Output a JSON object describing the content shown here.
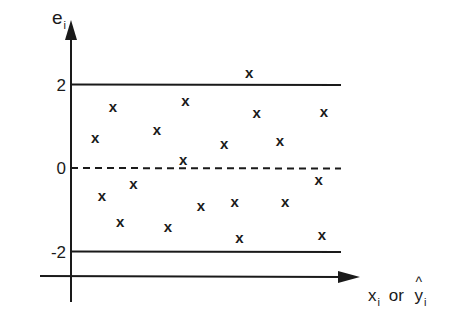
{
  "chart_data": {
    "type": "scatter",
    "title": "",
    "ylabel": "e",
    "ylabel_subscript": "i",
    "xlabel_parts": [
      "x",
      "i",
      "or",
      "y",
      "i"
    ],
    "xlabel": "x_i or ŷ_i",
    "yticks": [
      2,
      0,
      -2
    ],
    "ytick_labels": [
      "2",
      "0",
      "-2"
    ],
    "reference_lines": [
      {
        "y": 2,
        "style": "solid"
      },
      {
        "y": 0,
        "style": "dashed"
      },
      {
        "y": -2,
        "style": "solid"
      }
    ],
    "marker": "x",
    "ylim": [
      -2.6,
      3.5
    ],
    "points": [
      {
        "x": 0.55,
        "y": 0.72
      },
      {
        "x": 0.95,
        "y": 1.46
      },
      {
        "x": 0.7,
        "y": -0.67
      },
      {
        "x": 1.12,
        "y": -1.3
      },
      {
        "x": 1.42,
        "y": -0.38
      },
      {
        "x": 1.95,
        "y": 0.91
      },
      {
        "x": 2.2,
        "y": -1.42
      },
      {
        "x": 2.6,
        "y": 1.6
      },
      {
        "x": 2.55,
        "y": 0.19
      },
      {
        "x": 2.95,
        "y": -0.91
      },
      {
        "x": 3.48,
        "y": 0.58
      },
      {
        "x": 3.72,
        "y": -0.82
      },
      {
        "x": 3.83,
        "y": -1.68
      },
      {
        "x": 4.05,
        "y": 2.27
      },
      {
        "x": 4.22,
        "y": 1.32
      },
      {
        "x": 4.75,
        "y": 0.65
      },
      {
        "x": 4.87,
        "y": -0.82
      },
      {
        "x": 5.63,
        "y": -0.29
      },
      {
        "x": 5.75,
        "y": 1.34
      },
      {
        "x": 5.7,
        "y": -1.6
      }
    ]
  },
  "labels": {
    "y_axis_main": "e",
    "y_axis_sub": "i",
    "x_axis_x": "x",
    "x_axis_x_sub": "i",
    "x_axis_or": "or",
    "x_axis_y": "y",
    "x_axis_y_hat": "^",
    "x_axis_y_sub": "i"
  }
}
